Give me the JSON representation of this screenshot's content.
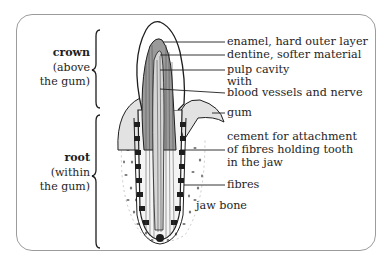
{
  "diagram": {
    "regions": [
      {
        "title": "crown",
        "lines": [
          "(above",
          "the gum)"
        ]
      },
      {
        "title": "root",
        "lines": [
          "(within",
          "the gum)"
        ]
      }
    ],
    "labels": {
      "enamel": "enamel, hard outer layer",
      "dentine": "dentine, softer material",
      "pulp": "pulp cavity",
      "with": "with",
      "vessels": "blood vessels and nerve",
      "gum": "gum",
      "cement1": "cement for attachment",
      "cement2": "of fibres holding tooth",
      "cement3": "in the jaw",
      "fibres": "fibres",
      "jawbone": "jaw bone"
    },
    "colors": {
      "border": "#9c9c9c",
      "ink": "#1e1e1e",
      "gum_shade": "#cfcfcf"
    }
  }
}
